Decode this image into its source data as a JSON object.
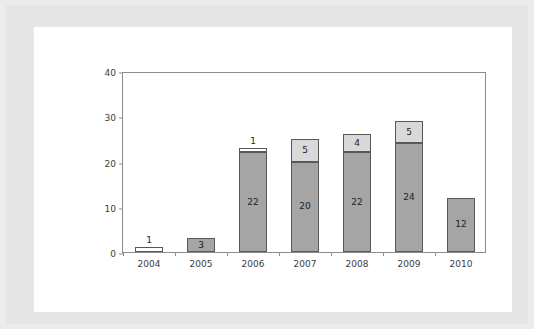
{
  "chart_data": {
    "type": "bar",
    "title": "",
    "subtitle": "",
    "xlabel": "",
    "ylabel": "",
    "stacked": true,
    "grid": false,
    "legend": "none",
    "ylim": [
      0,
      40
    ],
    "yticks": [
      0,
      10,
      20,
      30,
      40
    ],
    "ytick_labels": [
      "0",
      "10",
      "20",
      "30",
      "40"
    ],
    "categories": [
      "2004",
      "2005",
      "2006",
      "2007",
      "2008",
      "2009",
      "2010"
    ],
    "series": [
      {
        "name": "lower",
        "color": "#a5a5a5",
        "values": [
          0,
          3,
          22,
          20,
          22,
          24,
          12
        ],
        "labels": [
          "",
          "3",
          "22",
          "20",
          "22",
          "24",
          "12"
        ]
      },
      {
        "name": "upper",
        "color": "#d9d9d9",
        "values": [
          1,
          0,
          1,
          5,
          4,
          5,
          0
        ],
        "labels": [
          "1",
          "",
          "1",
          "5",
          "4",
          "5",
          ""
        ]
      }
    ],
    "totals": [
      1,
      3,
      23,
      25,
      26,
      29,
      12
    ],
    "bars": [
      {
        "category": "2004",
        "lower": 0,
        "upper": 1,
        "total": 1,
        "lower_label": "",
        "upper_label": "1",
        "upper_label_outside": true,
        "upper_fill": "#ffffff"
      },
      {
        "category": "2005",
        "lower": 3,
        "upper": 0,
        "total": 3,
        "lower_label": "3",
        "upper_label": "",
        "upper_label_outside": false,
        "upper_fill": "#d9d9d9"
      },
      {
        "category": "2006",
        "lower": 22,
        "upper": 1,
        "total": 23,
        "lower_label": "22",
        "upper_label": "1",
        "upper_label_outside": true,
        "upper_fill": "#ffffff"
      },
      {
        "category": "2007",
        "lower": 20,
        "upper": 5,
        "total": 25,
        "lower_label": "20",
        "upper_label": "5",
        "upper_label_outside": false,
        "upper_fill": "#d9d9d9"
      },
      {
        "category": "2008",
        "lower": 22,
        "upper": 4,
        "total": 26,
        "lower_label": "22",
        "upper_label": "4",
        "upper_label_outside": false,
        "upper_fill": "#d9d9d9"
      },
      {
        "category": "2009",
        "lower": 24,
        "upper": 5,
        "total": 29,
        "lower_label": "24",
        "upper_label": "5",
        "upper_label_outside": false,
        "upper_fill": "#d9d9d9"
      },
      {
        "category": "2010",
        "lower": 12,
        "upper": 0,
        "total": 12,
        "lower_label": "12",
        "upper_label": "",
        "upper_label_outside": false,
        "upper_fill": "#d9d9d9"
      }
    ],
    "colors": {
      "lower_series": "#a5a5a5",
      "upper_series": "#d9d9d9",
      "bar_outline": "#595959",
      "axis": "#8c8c8c",
      "text": "#3b3b3b",
      "plot_background": "#ffffff",
      "page_border": "#e6e6e6"
    }
  }
}
